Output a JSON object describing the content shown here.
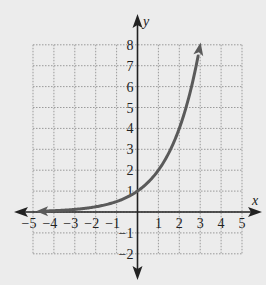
{
  "chart_data": {
    "type": "line",
    "title": "",
    "function": "y = 2^x",
    "xlabel": "x",
    "ylabel": "y",
    "xlim": [
      -5,
      5
    ],
    "ylim": [
      -2,
      8
    ],
    "grid": true,
    "x_ticks": [
      "-5",
      "-4",
      "-3",
      "-2",
      "-1",
      "1",
      "2",
      "3",
      "4",
      "5"
    ],
    "y_ticks": [
      "8",
      "7",
      "6",
      "5",
      "4",
      "3",
      "2",
      "1",
      "-1",
      "-2"
    ],
    "series": [
      {
        "name": "exponential curve",
        "color": "#5a5a5a",
        "x": [
          -4.8,
          -4,
          -3,
          -2,
          -1,
          0,
          1,
          2,
          3
        ],
        "y": [
          0.036,
          0.0625,
          0.125,
          0.25,
          0.5,
          1,
          2,
          4,
          8
        ],
        "arrow_left": true,
        "arrow_right": true
      }
    ]
  },
  "labels": {
    "x_axis": "x",
    "y_axis": "y"
  }
}
